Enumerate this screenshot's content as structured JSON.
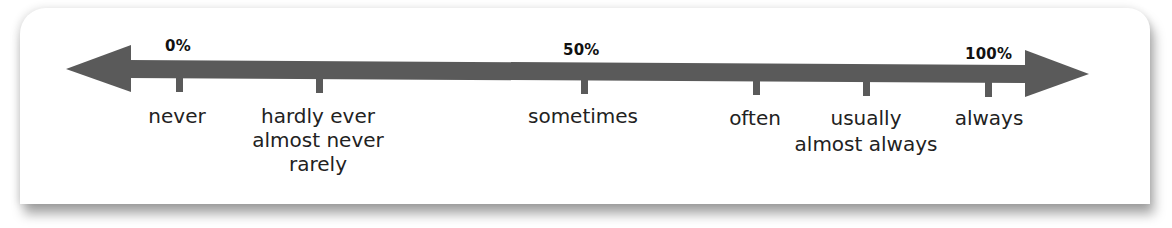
{
  "diagram": {
    "type": "frequency-adverb-scale",
    "arrow_color": "#5a5a5a",
    "percent_marks": [
      {
        "label": "0%"
      },
      {
        "label": "50%"
      },
      {
        "label": "100%"
      }
    ],
    "ticks": [
      {
        "label_lines": [
          "never"
        ]
      },
      {
        "label_lines": [
          "hardly ever",
          "almost never",
          "rarely"
        ]
      },
      {
        "label_lines": [
          "sometimes"
        ]
      },
      {
        "label_lines": [
          "often"
        ]
      },
      {
        "label_lines": [
          "usually",
          "almost always"
        ]
      },
      {
        "label_lines": [
          "always"
        ]
      }
    ]
  }
}
